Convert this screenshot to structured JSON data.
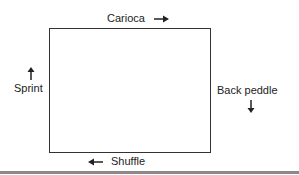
{
  "diagram": {
    "type": "agility-drill-rectangle",
    "top": {
      "label": "Carioca",
      "arrow": "right"
    },
    "right": {
      "label": "Back peddle",
      "arrow": "down"
    },
    "bottom": {
      "label": "Shuffle",
      "arrow": "left"
    },
    "left": {
      "label": "Sprint",
      "arrow": "up"
    }
  }
}
